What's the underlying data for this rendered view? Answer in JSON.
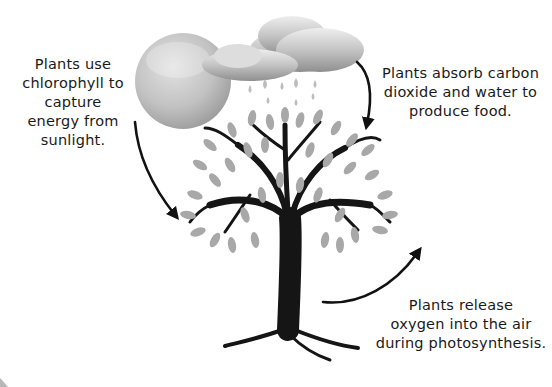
{
  "diagram": {
    "title": "Photosynthesis",
    "labels": {
      "sunlight": [
        "Plants use",
        "chlorophyll to",
        "capture",
        "energy from",
        "sunlight."
      ],
      "absorb": [
        "Plants absorb carbon",
        "dioxide and water to",
        "produce food."
      ],
      "release": [
        "Plants release",
        "oxygen into the air",
        "during photosynthesis."
      ]
    },
    "elements": {
      "sun": "sun-icon",
      "cloud": "rain-cloud-icon",
      "tree": "tree-icon"
    },
    "colors": {
      "text": "#1a1a1a",
      "trunk": "#151515",
      "leaf": "#a8a8a8",
      "sun": "#bdbdbd",
      "cloud": "#b5b5b5"
    }
  }
}
